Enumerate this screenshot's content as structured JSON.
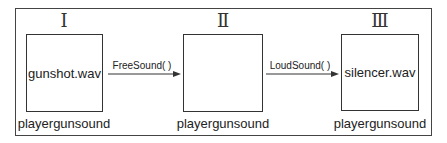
{
  "stages": [
    {
      "numeral": "Ⅰ",
      "content": "gunshot.wav",
      "caption": "playergunsound"
    },
    {
      "numeral": "Ⅱ",
      "content": "",
      "caption": "playergunsound"
    },
    {
      "numeral": "Ⅲ",
      "content": "silencer.wav",
      "caption": "playergunsound"
    }
  ],
  "transitions": [
    {
      "label": "FreeSound( )",
      "from": 0,
      "to": 1
    },
    {
      "label": "LoudSound( )",
      "from": 1,
      "to": 2
    }
  ]
}
